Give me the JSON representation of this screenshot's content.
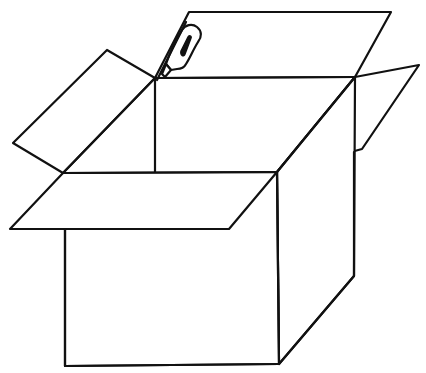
{
  "illustration": {
    "subject": "open cardboard box with box cutter",
    "style": "black line drawing on white",
    "colors": {
      "background": "#ffffff",
      "stroke": "#111111"
    },
    "parts": [
      {
        "name": "back-flap",
        "label": "Back flap"
      },
      {
        "name": "left-flap",
        "label": "Left flap"
      },
      {
        "name": "right-flap",
        "label": "Right flap"
      },
      {
        "name": "front-flap",
        "label": "Front flap"
      },
      {
        "name": "front-face",
        "label": "Front face"
      },
      {
        "name": "side-face",
        "label": "Right side face"
      },
      {
        "name": "box-cutter",
        "label": "Box cutter"
      }
    ]
  }
}
